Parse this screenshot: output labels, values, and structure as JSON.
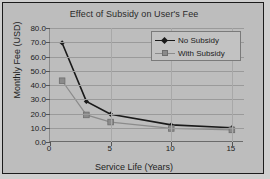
{
  "chart_data": {
    "type": "line",
    "title": "Effect of Subsidy on User's Fee",
    "xlabel": "Service Life (Years)",
    "ylabel": "Monthly Fee (USD)",
    "xlim": [
      0,
      16
    ],
    "ylim": [
      0,
      80
    ],
    "x_ticks": [
      0,
      5,
      10,
      15
    ],
    "x_tick_labels": [
      "0",
      "5",
      "10",
      "15"
    ],
    "y_ticks": [
      0,
      10,
      20,
      30,
      40,
      50,
      60,
      70,
      80
    ],
    "y_tick_labels": [
      "0.0",
      "10.0",
      "20.0",
      "30.0",
      "40.0",
      "50.0",
      "60.0",
      "70.0",
      "80.0"
    ],
    "grid": true,
    "grid_axis": "y",
    "legend_position": "top-right",
    "x": [
      1,
      3,
      5,
      10,
      15
    ],
    "series": [
      {
        "name": "No Subsidy",
        "values": [
          69.5,
          28.5,
          19.5,
          12.0,
          10.0
        ],
        "marker": "diamond",
        "color": "#1a1a1a"
      },
      {
        "name": "With Subsidy",
        "values": [
          43.0,
          19.0,
          14.0,
          9.5,
          8.5
        ],
        "marker": "square",
        "color": "#8b8b8b"
      }
    ]
  },
  "colors": {
    "frame_border": "#1c1c1c",
    "plot_background": "#bdbdbd",
    "gridline": "#9a9a9a",
    "series_1": "#1a1a1a",
    "series_2": "#8b8b8b",
    "text": "#1e1e1e"
  }
}
